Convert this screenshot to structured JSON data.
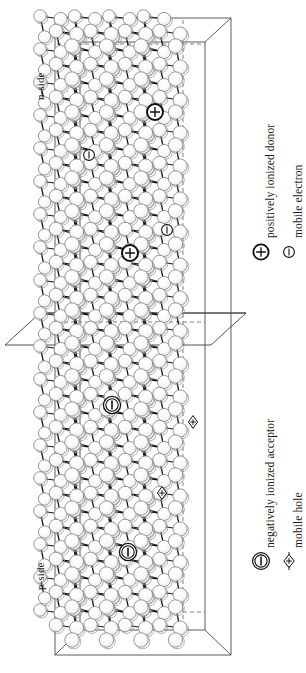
{
  "figure": {
    "type": "pn-junction-lattice-diagram",
    "region_labels": [
      {
        "id": "n-side",
        "text": "n-side"
      },
      {
        "id": "p-side",
        "text": "p-side"
      }
    ],
    "legend": {
      "items": [
        {
          "id": "positively-ionized-donor",
          "symbol": "circled-plus",
          "label": "positively ionized donor"
        },
        {
          "id": "mobile-electron",
          "symbol": "circled-minus",
          "label": "mobile electron"
        },
        {
          "id": "negatively-ionized-acceptor",
          "symbol": "double-circled-minus",
          "label": "negatively ionized acceptor"
        },
        {
          "id": "mobile-hole",
          "symbol": "lens-plus",
          "label": "mobile hole"
        }
      ]
    },
    "markers": {
      "donors": [
        {
          "x": 155,
          "y": 112
        },
        {
          "x": 130,
          "y": 253
        }
      ],
      "electrons": [
        {
          "x": 89,
          "y": 155
        },
        {
          "x": 167,
          "y": 230
        }
      ],
      "acceptors": [
        {
          "x": 112,
          "y": 405
        },
        {
          "x": 128,
          "y": 552
        }
      ],
      "holes": [
        {
          "x": 193,
          "y": 422
        },
        {
          "x": 162,
          "y": 493
        }
      ]
    },
    "colors": {
      "ink": "#1a1a1a",
      "atom_fill": "#fbfbfb",
      "atom_stroke": "#8c8c8c",
      "bond": "#151515",
      "box": "#3d3d3d",
      "background": "#ffffff"
    },
    "junction_plane": {
      "label": "metallurgical junction plane",
      "y": 333
    }
  }
}
